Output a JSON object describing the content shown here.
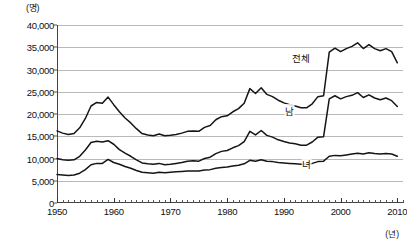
{
  "chart_data": {
    "type": "line",
    "title": "",
    "xlabel": "(년)",
    "ylabel": "(명)",
    "unit_top_label": "(명)",
    "unit_right_label": "(년)",
    "xlim": [
      1950,
      2011
    ],
    "ylim": [
      0,
      40000
    ],
    "grid": true,
    "legend_position": "inline-annotations",
    "y_ticks": [
      0,
      5000,
      10000,
      15000,
      20000,
      25000,
      30000,
      35000,
      40000
    ],
    "y_tick_labels": [
      "0",
      "5,000",
      "10,000",
      "15,000",
      "20,000",
      "25,000",
      "30,000",
      "35,000",
      "40,000"
    ],
    "x_ticks": [
      1950,
      1960,
      1970,
      1980,
      1990,
      2000,
      2010
    ],
    "x_tick_labels": [
      "1950",
      "1960",
      "1970",
      "1980",
      "1990",
      "2000",
      "2010"
    ],
    "x_minor_tick_interval": 1,
    "x": [
      1950,
      1951,
      1952,
      1953,
      1954,
      1955,
      1956,
      1957,
      1958,
      1959,
      1960,
      1961,
      1962,
      1963,
      1964,
      1965,
      1966,
      1967,
      1968,
      1969,
      1970,
      1971,
      1972,
      1973,
      1974,
      1975,
      1976,
      1977,
      1978,
      1979,
      1980,
      1981,
      1982,
      1983,
      1984,
      1985,
      1986,
      1987,
      1988,
      1989,
      1990,
      1991,
      1992,
      1993,
      1994,
      1995,
      1996,
      1997,
      1998,
      1999,
      2000,
      2001,
      2002,
      2003,
      2004,
      2005,
      2006,
      2007,
      2008,
      2009,
      2010
    ],
    "series": [
      {
        "name": "전체",
        "label": "전체",
        "label_x": 1993,
        "label_y": 32600,
        "color": "#151515",
        "values": [
          16200,
          15700,
          15400,
          15600,
          16900,
          19000,
          21800,
          22600,
          22400,
          23800,
          22100,
          20500,
          19100,
          18000,
          16700,
          15600,
          15300,
          15100,
          15500,
          15100,
          15200,
          15400,
          15700,
          16100,
          16200,
          16100,
          17000,
          17400,
          18700,
          19400,
          19600,
          20500,
          21200,
          22400,
          25700,
          24600,
          25900,
          24400,
          23900,
          23100,
          22500,
          22100,
          21800,
          21400,
          21400,
          22300,
          23900,
          24100,
          33900,
          34800,
          34000,
          34700,
          35200,
          36000,
          34700,
          35600,
          34700,
          34200,
          34700,
          34000,
          31500
        ],
        "annotation": "1998년 급증 (IMF 외환위기)"
      },
      {
        "name": "남",
        "label": "남",
        "label_x": 1991,
        "label_y": 20600,
        "color": "#151515",
        "values": [
          10000,
          9700,
          9600,
          9700,
          10500,
          11900,
          13600,
          13900,
          13700,
          14000,
          13200,
          12000,
          11200,
          10500,
          9700,
          9000,
          8800,
          8700,
          8900,
          8600,
          8700,
          8900,
          9100,
          9400,
          9500,
          9400,
          10000,
          10300,
          11100,
          11600,
          11800,
          12400,
          12900,
          13800,
          16100,
          15300,
          16300,
          15200,
          14800,
          14200,
          13800,
          13500,
          13300,
          13000,
          13000,
          13700,
          14800,
          14900,
          23400,
          24100,
          23400,
          23900,
          24200,
          24800,
          23700,
          24300,
          23600,
          23200,
          23600,
          23000,
          21700
        ]
      },
      {
        "name": "녀",
        "label": "녀",
        "label_x": 1994,
        "label_y": 8700,
        "color": "#151515",
        "values": [
          6400,
          6300,
          6200,
          6300,
          6700,
          7500,
          8600,
          8900,
          8900,
          9800,
          9100,
          8700,
          8200,
          7800,
          7300,
          6900,
          6800,
          6700,
          6900,
          6800,
          6900,
          7000,
          7100,
          7200,
          7200,
          7200,
          7400,
          7500,
          7800,
          8000,
          8100,
          8300,
          8500,
          8800,
          9600,
          9400,
          9700,
          9400,
          9300,
          9100,
          9000,
          8900,
          8800,
          8700,
          8700,
          8900,
          9300,
          9400,
          10500,
          10700,
          10600,
          10800,
          11000,
          11200,
          11000,
          11300,
          11100,
          11000,
          11100,
          11000,
          10500
        ]
      }
    ]
  }
}
